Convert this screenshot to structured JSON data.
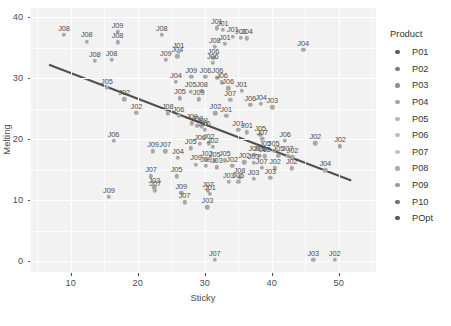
{
  "chart_data": {
    "type": "scatter",
    "title": "",
    "xlabel": "Sticky",
    "ylabel": "Melting",
    "xlim": [
      4.0,
      55.5
    ],
    "ylim": [
      -1.8,
      41.5
    ],
    "xticks": [
      10,
      20,
      30,
      40,
      50
    ],
    "yticks": [
      0,
      10,
      20,
      30,
      40
    ],
    "xminor": [
      5,
      15,
      25,
      35,
      45,
      55
    ],
    "yminor": [
      5,
      15,
      25,
      35,
      40
    ],
    "grid": true,
    "legend": {
      "title": "Product",
      "position": "right",
      "entries": [
        {
          "label": "P01",
          "color": "#5c5c5c"
        },
        {
          "label": "P02",
          "color": "#7a7a7a"
        },
        {
          "label": "P03",
          "color": "#8f8f8f"
        },
        {
          "label": "P04",
          "color": "#a6a6a6"
        },
        {
          "label": "P05",
          "color": "#b5b5b5"
        },
        {
          "label": "P06",
          "color": "#bdbdbd"
        },
        {
          "label": "P07",
          "color": "#c4c4c4"
        },
        {
          "label": "P08",
          "color": "#ababab"
        },
        {
          "label": "P09",
          "color": "#999999"
        },
        {
          "label": "P10",
          "color": "#707070"
        },
        {
          "label": "POpt",
          "color": "#565656"
        }
      ]
    },
    "trendline": {
      "type": "linear",
      "color": "#4f4f4f",
      "x0": 6.7,
      "y0": 32.2,
      "x1": 51.8,
      "y1": 13.2
    },
    "point_color": "#a8a8a8",
    "label_color": "#4d4d4d",
    "points": [
      {
        "x": 9.0,
        "y": 37.1,
        "label": "J08"
      },
      {
        "x": 12.4,
        "y": 36.0,
        "label": "J08"
      },
      {
        "x": 17.0,
        "y": 37.6,
        "label": "J09"
      },
      {
        "x": 17.0,
        "y": 35.9,
        "label": "J08"
      },
      {
        "x": 16.1,
        "y": 33.0,
        "label": "J08"
      },
      {
        "x": 13.6,
        "y": 32.8,
        "label": "J08"
      },
      {
        "x": 23.6,
        "y": 37.1,
        "label": "J08"
      },
      {
        "x": 24.2,
        "y": 33.0,
        "label": "J09"
      },
      {
        "x": 25.9,
        "y": 33.6,
        "label": "J04"
      },
      {
        "x": 26.1,
        "y": 34.3,
        "label": "J01"
      },
      {
        "x": 31.8,
        "y": 38.2,
        "label": "J01"
      },
      {
        "x": 32.7,
        "y": 37.9,
        "label": "J01"
      },
      {
        "x": 34.2,
        "y": 36.8,
        "label": "J01"
      },
      {
        "x": 35.4,
        "y": 36.6,
        "label": "J01"
      },
      {
        "x": 36.3,
        "y": 36.5,
        "label": "J04"
      },
      {
        "x": 33.0,
        "y": 35.6,
        "label": "J01"
      },
      {
        "x": 31.5,
        "y": 35.1,
        "label": "J08"
      },
      {
        "x": 31.3,
        "y": 33.3,
        "label": "J06"
      },
      {
        "x": 31.2,
        "y": 32.5,
        "label": "J06"
      },
      {
        "x": 44.7,
        "y": 34.6,
        "label": "J04"
      },
      {
        "x": 28.0,
        "y": 30.2,
        "label": "J09"
      },
      {
        "x": 30.1,
        "y": 30.2,
        "label": "J06"
      },
      {
        "x": 31.9,
        "y": 30.1,
        "label": "J06"
      },
      {
        "x": 32.6,
        "y": 29.3,
        "label": "J06"
      },
      {
        "x": 25.7,
        "y": 29.4,
        "label": "J04"
      },
      {
        "x": 27.9,
        "y": 27.8,
        "label": "J05"
      },
      {
        "x": 29.6,
        "y": 27.9,
        "label": "J08"
      },
      {
        "x": 33.5,
        "y": 28.3,
        "label": "J06"
      },
      {
        "x": 35.5,
        "y": 27.9,
        "label": "J01"
      },
      {
        "x": 15.4,
        "y": 28.4,
        "label": "J05"
      },
      {
        "x": 18.0,
        "y": 26.5,
        "label": "J02"
      },
      {
        "x": 26.3,
        "y": 26.7,
        "label": "J05"
      },
      {
        "x": 29.1,
        "y": 26.5,
        "label": "J09"
      },
      {
        "x": 33.8,
        "y": 26.4,
        "label": "J07"
      },
      {
        "x": 36.8,
        "y": 25.6,
        "label": "J06"
      },
      {
        "x": 38.4,
        "y": 25.8,
        "label": "J04"
      },
      {
        "x": 40.1,
        "y": 25.2,
        "label": "J03"
      },
      {
        "x": 19.8,
        "y": 24.3,
        "label": "J02"
      },
      {
        "x": 24.5,
        "y": 24.2,
        "label": "J08"
      },
      {
        "x": 26.1,
        "y": 23.8,
        "label": "J06"
      },
      {
        "x": 31.6,
        "y": 24.2,
        "label": "J02"
      },
      {
        "x": 33.2,
        "y": 23.8,
        "label": "J01"
      },
      {
        "x": 28.1,
        "y": 22.6,
        "label": "J09"
      },
      {
        "x": 28.9,
        "y": 22.2,
        "label": "J08"
      },
      {
        "x": 29.6,
        "y": 22.0,
        "label": "J08"
      },
      {
        "x": 30.0,
        "y": 21.5,
        "label": "J06"
      },
      {
        "x": 35.0,
        "y": 21.5,
        "label": "J01"
      },
      {
        "x": 36.3,
        "y": 21.1,
        "label": "J01"
      },
      {
        "x": 38.3,
        "y": 20.7,
        "label": "J05"
      },
      {
        "x": 38.6,
        "y": 20.0,
        "label": "J07"
      },
      {
        "x": 16.4,
        "y": 19.7,
        "label": "J06"
      },
      {
        "x": 29.3,
        "y": 19.2,
        "label": "J06"
      },
      {
        "x": 30.6,
        "y": 19.3,
        "label": "J02"
      },
      {
        "x": 31.2,
        "y": 18.7,
        "label": "J02"
      },
      {
        "x": 27.9,
        "y": 18.5,
        "label": "J05"
      },
      {
        "x": 42.0,
        "y": 19.7,
        "label": "J06"
      },
      {
        "x": 46.5,
        "y": 19.3,
        "label": "J02"
      },
      {
        "x": 50.2,
        "y": 18.8,
        "label": "J02"
      },
      {
        "x": 22.3,
        "y": 18.0,
        "label": "J09"
      },
      {
        "x": 24.1,
        "y": 18.0,
        "label": "J07"
      },
      {
        "x": 39.0,
        "y": 18.2,
        "label": "J05"
      },
      {
        "x": 40.3,
        "y": 18.1,
        "label": "J05"
      },
      {
        "x": 37.4,
        "y": 17.4,
        "label": "J09"
      },
      {
        "x": 38.2,
        "y": 17.3,
        "label": "J05"
      },
      {
        "x": 39.0,
        "y": 17.2,
        "label": "J02"
      },
      {
        "x": 41.0,
        "y": 17.3,
        "label": "J05"
      },
      {
        "x": 42.4,
        "y": 17.3,
        "label": "J07"
      },
      {
        "x": 43.1,
        "y": 17.0,
        "label": "J02"
      },
      {
        "x": 26.0,
        "y": 16.9,
        "label": "J04"
      },
      {
        "x": 30.3,
        "y": 16.6,
        "label": "J02"
      },
      {
        "x": 31.5,
        "y": 16.4,
        "label": "J05"
      },
      {
        "x": 33.0,
        "y": 16.5,
        "label": "J05"
      },
      {
        "x": 35.9,
        "y": 16.2,
        "label": "J02"
      },
      {
        "x": 37.3,
        "y": 16.1,
        "label": "J03"
      },
      {
        "x": 28.7,
        "y": 15.8,
        "label": "J09"
      },
      {
        "x": 30.2,
        "y": 15.6,
        "label": "J09"
      },
      {
        "x": 31.8,
        "y": 15.4,
        "label": "J03"
      },
      {
        "x": 34.1,
        "y": 15.6,
        "label": "J02"
      },
      {
        "x": 38.5,
        "y": 15.3,
        "label": "J07"
      },
      {
        "x": 40.5,
        "y": 15.2,
        "label": "J02"
      },
      {
        "x": 43.0,
        "y": 15.2,
        "label": "J02"
      },
      {
        "x": 48.0,
        "y": 14.9,
        "label": "J04"
      },
      {
        "x": 22.0,
        "y": 13.9,
        "label": "J07"
      },
      {
        "x": 25.8,
        "y": 13.9,
        "label": "J05"
      },
      {
        "x": 35.2,
        "y": 13.7,
        "label": "J08"
      },
      {
        "x": 37.3,
        "y": 13.5,
        "label": "J03"
      },
      {
        "x": 39.8,
        "y": 13.6,
        "label": "J03"
      },
      {
        "x": 33.6,
        "y": 13.0,
        "label": "J03"
      },
      {
        "x": 35.0,
        "y": 13.0,
        "label": "J05"
      },
      {
        "x": 22.5,
        "y": 12.1,
        "label": "J03"
      },
      {
        "x": 22.6,
        "y": 11.6,
        "label": "J07"
      },
      {
        "x": 26.5,
        "y": 11.2,
        "label": "J09"
      },
      {
        "x": 30.5,
        "y": 11.5,
        "label": "J07"
      },
      {
        "x": 30.8,
        "y": 11.0,
        "label": "J01"
      },
      {
        "x": 15.7,
        "y": 10.5,
        "label": "J09"
      },
      {
        "x": 27.0,
        "y": 9.6,
        "label": "J07"
      },
      {
        "x": 30.4,
        "y": 8.8,
        "label": "J03"
      },
      {
        "x": 46.2,
        "y": 0.2,
        "label": "J03"
      },
      {
        "x": 49.4,
        "y": 0.2,
        "label": "J02"
      },
      {
        "x": 31.5,
        "y": 0.2,
        "label": "J07"
      }
    ]
  }
}
